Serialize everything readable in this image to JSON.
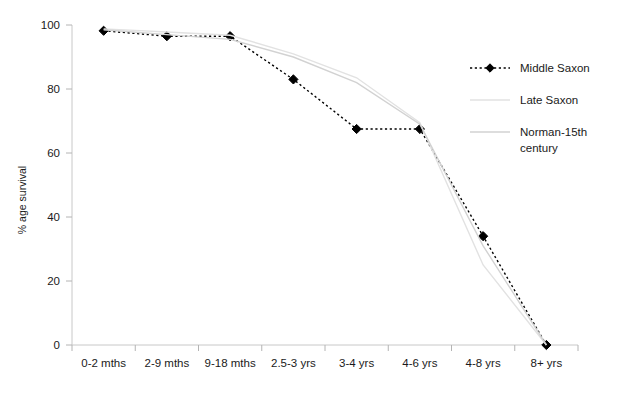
{
  "chart_data": {
    "type": "line",
    "title": "",
    "xlabel": "",
    "ylabel": "% age survival",
    "ylim": [
      0,
      100
    ],
    "yticks": [
      0,
      20,
      40,
      60,
      80,
      100
    ],
    "ytick_labels": [
      "0",
      "20",
      "40",
      "60",
      "80",
      "100"
    ],
    "grid": false,
    "legend_position": "right",
    "categories": [
      "0-2 mths",
      "2-9 mths",
      "9-18 mths",
      "2.5-3 yrs",
      "3-4 yrs",
      "4-6 yrs",
      "4-8 yrs",
      "8+ yrs"
    ],
    "series": [
      {
        "name": "Middle Saxon",
        "style": "dotted-with-diamond-markers",
        "color": "#000000",
        "values": [
          98.2,
          96.5,
          96.5,
          83.0,
          67.5,
          67.5,
          34.0,
          0.0
        ]
      },
      {
        "name": "Late Saxon",
        "style": "solid-very-light-gray",
        "color": "#e2e2e2",
        "values": [
          98.8,
          97.8,
          96.8,
          91.0,
          83.5,
          69.5,
          25.0,
          0.0
        ]
      },
      {
        "name": "Norman-15th century",
        "style": "solid-light-gray",
        "color": "#d2d2d2",
        "values": [
          98.5,
          97.0,
          95.5,
          90.0,
          82.0,
          69.0,
          31.0,
          0.0
        ]
      }
    ]
  },
  "legend": {
    "items": [
      {
        "label": "Middle Saxon"
      },
      {
        "label": "Late Saxon"
      },
      {
        "label": "Norman-15th century"
      }
    ]
  },
  "axes": {
    "y_title": "% age survival"
  }
}
